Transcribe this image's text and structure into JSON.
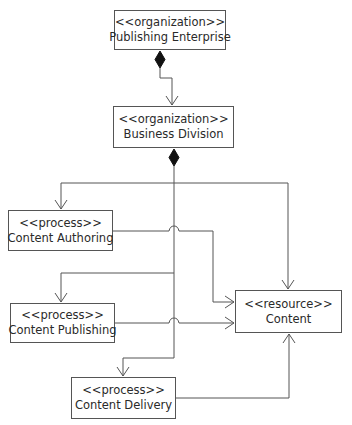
{
  "diagram": {
    "nodes": {
      "publishing_enterprise": {
        "stereotype": "<<organization>>",
        "name": "Publishing Enterprise"
      },
      "business_division": {
        "stereotype": "<<organization>>",
        "name": "Business Division"
      },
      "content_authoring": {
        "stereotype": "<<process>>",
        "name": "Content Authoring"
      },
      "content_publishing": {
        "stereotype": "<<process>>",
        "name": "Content Publishing"
      },
      "content_delivery": {
        "stereotype": "<<process>>",
        "name": "Content Delivery"
      },
      "content": {
        "stereotype": "<<resource>>",
        "name": "Content"
      }
    },
    "edges": [
      {
        "from": "Publishing Enterprise",
        "to": "Business Division",
        "type": "composition"
      },
      {
        "from": "Business Division",
        "to": "Content Authoring",
        "type": "composition"
      },
      {
        "from": "Business Division",
        "to": "Content Publishing",
        "type": "composition"
      },
      {
        "from": "Business Division",
        "to": "Content Delivery",
        "type": "composition"
      },
      {
        "from": "Business Division",
        "to": "Content",
        "type": "composition"
      },
      {
        "from": "Content Authoring",
        "to": "Content",
        "type": "dependency"
      },
      {
        "from": "Content Publishing",
        "to": "Content",
        "type": "dependency"
      },
      {
        "from": "Content Delivery",
        "to": "Content",
        "type": "dependency"
      }
    ],
    "colors": {
      "line": "#555555",
      "text": "#2a2a2a",
      "diamond": "#111111"
    }
  }
}
